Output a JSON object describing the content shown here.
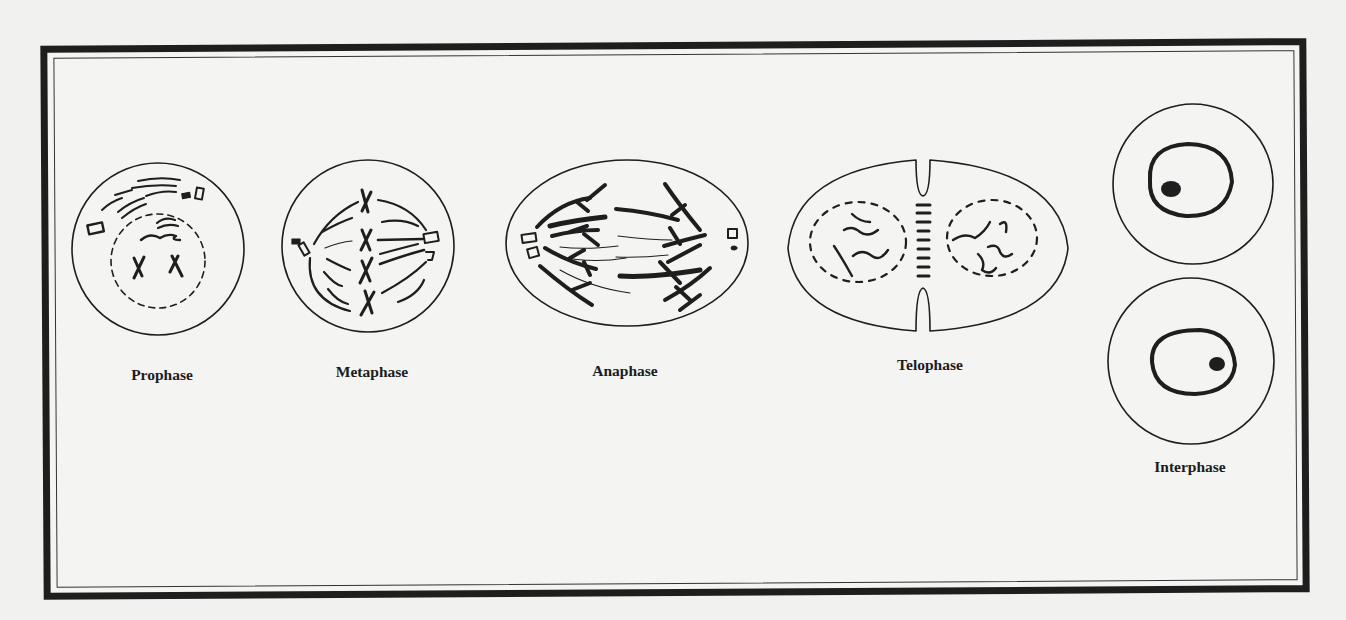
{
  "figure": {
    "type": "mitosis-stages-diagram",
    "stages": [
      {
        "id": "prophase",
        "label": "Prophase"
      },
      {
        "id": "metaphase",
        "label": "Metaphase"
      },
      {
        "id": "anaphase",
        "label": "Anaphase"
      },
      {
        "id": "telophase",
        "label": "Telophase"
      },
      {
        "id": "interphase",
        "label": "Interphase"
      }
    ],
    "colors": {
      "ink": "#1e1e1e",
      "paper": "#f4f4f2",
      "background": "#f1f1ef"
    }
  }
}
